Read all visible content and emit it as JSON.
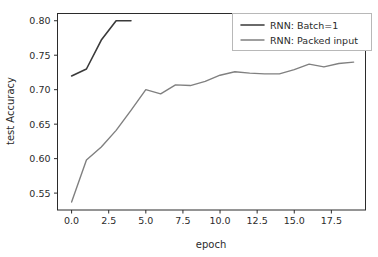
{
  "chart_data": {
    "type": "line",
    "title": "",
    "xlabel": "epoch",
    "ylabel": "test Accuracy",
    "xlim": [
      -0.95,
      19.8
    ],
    "ylim": [
      0.5255,
      0.8105
    ],
    "xticks": [
      "0.0",
      "2.5",
      "5.0",
      "7.5",
      "10.0",
      "12.5",
      "15.0",
      "17.5"
    ],
    "xtick_values": [
      0.0,
      2.5,
      5.0,
      7.5,
      10.0,
      12.5,
      15.0,
      17.5
    ],
    "yticks": [
      "0.55",
      "0.60",
      "0.65",
      "0.70",
      "0.75",
      "0.80"
    ],
    "ytick_values": [
      0.55,
      0.6,
      0.65,
      0.7,
      0.75,
      0.8
    ],
    "grid": false,
    "legend_position": "upper right",
    "series": [
      {
        "name": "RNN: Batch=1",
        "color": "#3a3a3a",
        "linewidth": 1.6,
        "x": [
          0,
          1,
          2,
          3,
          4
        ],
        "values": [
          0.72,
          0.73,
          0.772,
          0.8,
          0.8
        ]
      },
      {
        "name": "RNN: Packed input",
        "color": "#808080",
        "linewidth": 1.4,
        "x": [
          0,
          1,
          2,
          3,
          4,
          5,
          6,
          7,
          8,
          9,
          10,
          11,
          12,
          13,
          14,
          15,
          16,
          17,
          18,
          19
        ],
        "values": [
          0.537,
          0.598,
          0.617,
          0.641,
          0.67,
          0.7,
          0.694,
          0.707,
          0.706,
          0.712,
          0.721,
          0.726,
          0.724,
          0.723,
          0.723,
          0.729,
          0.737,
          0.733,
          0.738,
          0.74
        ]
      }
    ]
  },
  "legend": {
    "entries": [
      {
        "label": "RNN: Batch=1",
        "color": "#3a3a3a"
      },
      {
        "label": "RNN: Packed input",
        "color": "#808080"
      }
    ]
  },
  "colors": {
    "background": "#ffffff",
    "axis": "#2b2b2b",
    "legend_border": "#b8b8b8",
    "batch_series": "#3a3a3a",
    "packed_series": "#808080"
  }
}
